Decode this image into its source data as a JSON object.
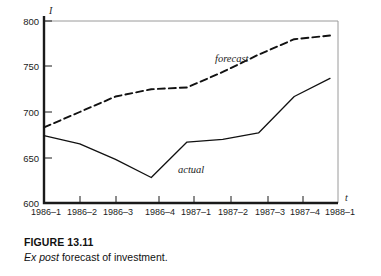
{
  "figure": {
    "caption_title": "FIGURE 13.11",
    "caption_emphasis": "Ex post",
    "caption_rest": " forecast of investment."
  },
  "axes": {
    "y_axis_name": "I",
    "x_axis_name": "t",
    "y_ticks": [
      "800",
      "750",
      "700",
      "650",
      "600"
    ],
    "x_ticks": [
      "1986–1",
      "1986–2",
      "1986–3",
      "1986–4",
      "1987–1",
      "1987–2",
      "1987–3",
      "1987–4",
      "1988–1"
    ]
  },
  "annotations": {
    "forecast_label": "forecast",
    "actual_label": "actual"
  },
  "colors": {
    "line": "#111111",
    "frame": "#9a9a9a",
    "axis": "#1a1a1a",
    "background": "#ffffff"
  },
  "chart_data": {
    "type": "line",
    "title": "Ex post forecast of investment.",
    "xlabel": "t",
    "ylabel": "I",
    "ylim": [
      600,
      800
    ],
    "grid": false,
    "legend_position": "inline-annotation",
    "categories": [
      "1986–1",
      "1986–2",
      "1986–3",
      "1986–4",
      "1987–1",
      "1987–2",
      "1987–3",
      "1987–4",
      "1988–1"
    ],
    "series": [
      {
        "name": "actual",
        "style": "solid",
        "values": [
          674,
          665,
          648,
          628,
          667,
          670,
          677,
          717,
          737
        ]
      },
      {
        "name": "forecast",
        "style": "dashed",
        "values": [
          683,
          700,
          717,
          725,
          727,
          744,
          763,
          780,
          784
        ]
      }
    ]
  }
}
